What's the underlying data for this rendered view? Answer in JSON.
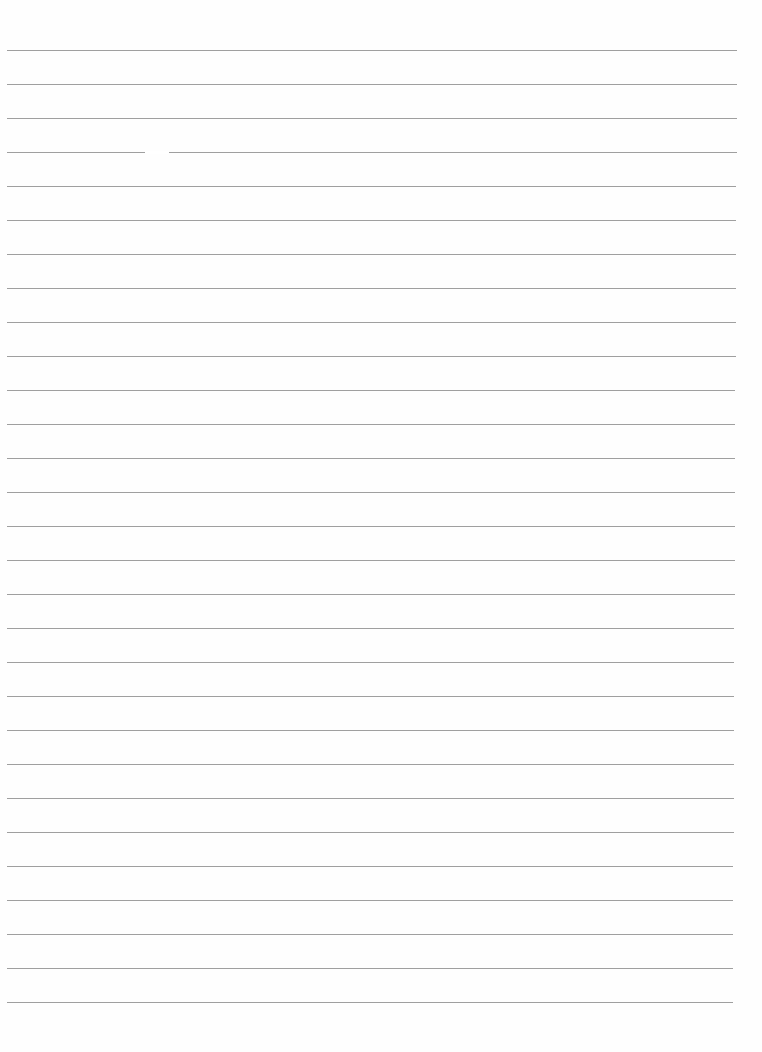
{
  "document": {
    "type": "lined paper",
    "background_color": "#ffffff",
    "rule_color": "#8e8e8e",
    "rule_count": 29,
    "first_rule_y": 50,
    "rule_spacing": 34,
    "rule_left_x": 7,
    "rule_right_x": 737,
    "text_lines": []
  }
}
